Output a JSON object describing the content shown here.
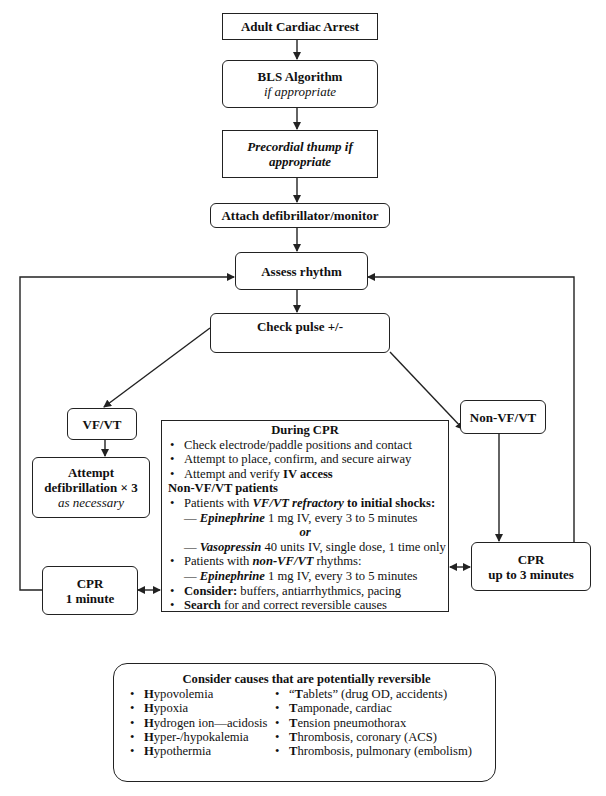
{
  "flowchart": {
    "start": {
      "label": "Adult Cardiac Arrest"
    },
    "bls": {
      "title": "BLS Algorithm",
      "subtitle": "if appropriate"
    },
    "precordial": {
      "line1": "Precordial thump if",
      "line2": "appropriate"
    },
    "attach": {
      "label": "Attach defibrillator/monitor"
    },
    "assess": {
      "label": "Assess rhythm"
    },
    "check_pulse": {
      "label": "Check pulse +/-"
    },
    "vfvt": {
      "label": "VF/VT"
    },
    "defib": {
      "line1": "Attempt",
      "line2": "defibrillation × 3",
      "line3": "as necessary"
    },
    "cpr_1min": {
      "line1": "CPR",
      "line2": "1 minute"
    },
    "nonvfvt": {
      "label": "Non-VF/VT"
    },
    "cpr_3min": {
      "line1": "CPR",
      "line2": "up to 3 minutes"
    }
  },
  "during_cpr": {
    "title": "During CPR",
    "item1": "Check electrode/paddle positions and contact",
    "item2": "Attempt to place, confirm, and secure airway",
    "item3_pre": "Attempt and verify ",
    "item3_bold": "IV access",
    "section": "Non-VF/VT patients",
    "item4_pre": "Patients with ",
    "item4_em": "VF/VT refractory",
    "item4_post": " to initial shocks:",
    "epi1_dash": "— ",
    "epi1_drug": "Epinephrine",
    "epi1_rest": " 1 mg IV, every 3 to 5 minutes",
    "or": "or",
    "vaso_dash": "— ",
    "vaso_drug": "Vasopressin",
    "vaso_rest": " 40 units IV, single dose, 1 time only",
    "item5_pre": "Patients with ",
    "item5_em": "non-VF/VT",
    "item5_post": " rhythms:",
    "epi2_dash": "— ",
    "epi2_drug": "Epinephrine",
    "epi2_rest": " 1 mg IV, every 3 to 5 minutes",
    "item6_bold": "Consider:",
    "item6_rest": " buffers, antiarrhythmics, pacing",
    "item7_bold": "Search",
    "item7_rest": " for and correct reversible causes",
    "bullet": "•"
  },
  "reversible_causes": {
    "title": "Consider causes that are potentially reversible",
    "bullet": "•",
    "left": [
      {
        "letter": "H",
        "rest": "ypovolemia"
      },
      {
        "letter": "H",
        "rest": "ypoxia"
      },
      {
        "letter": "H",
        "rest": "ydrogen ion—acidosis"
      },
      {
        "letter": "H",
        "rest": "yper-/hypokalemia"
      },
      {
        "letter": "H",
        "rest": "ypothermia"
      }
    ],
    "right": [
      {
        "pre": "“",
        "letter": "T",
        "rest": "ablets” (drug OD, accidents)"
      },
      {
        "pre": "",
        "letter": "T",
        "rest": "amponade, cardiac"
      },
      {
        "pre": "",
        "letter": "T",
        "rest": "ension pneumothorax"
      },
      {
        "pre": "",
        "letter": "T",
        "rest": "hrombosis, coronary (ACS)"
      },
      {
        "pre": "",
        "letter": "T",
        "rest": "hrombosis, pulmonary (embolism)"
      }
    ]
  },
  "colors": {
    "line": "#222222",
    "background": "#ffffff",
    "text": "#111111"
  }
}
